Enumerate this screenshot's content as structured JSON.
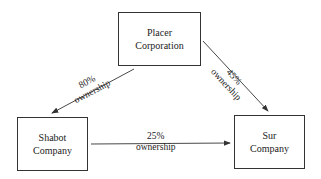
{
  "nodes": {
    "placer": {
      "line1": "Placer",
      "line2": "Corporation"
    },
    "shabot": {
      "line1": "Shabot",
      "line2": "Company"
    },
    "sur": {
      "line1": "Sur",
      "line2": "Company"
    }
  },
  "edges": {
    "placer_shabot": {
      "pct": "80%",
      "text": "ownership"
    },
    "placer_sur": {
      "pct": "45%",
      "text": "ownership"
    },
    "shabot_sur": {
      "pct": "25%",
      "text": "ownership"
    }
  }
}
